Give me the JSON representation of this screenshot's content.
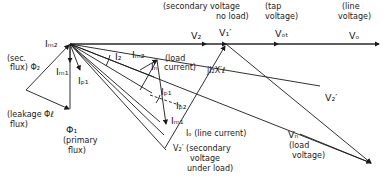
{
  "diagram": {
    "type": "phasor diagram",
    "line_color": "#1a1a1a",
    "background": "#ffffff",
    "labels": {
      "sec_voltage_no_load": "(secondary voltage",
      "no_load": "no load)",
      "tap_voltage_a": "(tap",
      "tap_voltage_b": "voltage)",
      "line_voltage_a": "(line",
      "line_voltage_b": "voltage)",
      "V2": "V₂",
      "V1p": "V₁′",
      "Vot": "Vₒₜ",
      "Vo": "Vₒ",
      "Im2_origin": "Iₘ₂",
      "sec_flux_a": "(sec.",
      "sec_flux_b": "flux) Φ₂",
      "Im1": "Iₘ₁",
      "Ip1_left": "Iₚ₁",
      "leakage_flux_a": "(leakage Φℓ",
      "leakage_flux_b": "flux)",
      "phi1": "Φ₁",
      "primary_flux_a": "(primary",
      "primary_flux_b": "flux)",
      "I2": "I₂",
      "Im2_mid": "Iₘ₂",
      "In": "Iₙ",
      "load_current_a": "(load",
      "load_current_b": "current)",
      "jI2X": "jI₂X′ℓ",
      "Ip1_mid": "Iₚ₁",
      "Ip2": "Iₚ₂",
      "Im1_mid": "Iₘ₁",
      "Io": "Iₒ (line current)",
      "V2p_bottom": "V₂′ (secondary",
      "sec_under_load_b": "voltage",
      "sec_under_load_c": "under load)",
      "V2p_right": "V₂′",
      "Vn": "Vₙ",
      "load_voltage_a": "(load",
      "load_voltage_b": "voltage)"
    }
  }
}
